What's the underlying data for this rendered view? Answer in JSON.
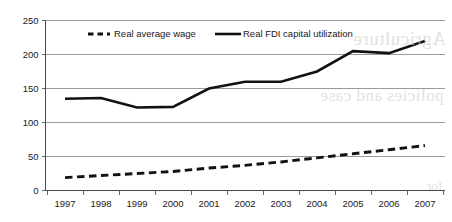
{
  "chart_data": {
    "type": "line",
    "title": "",
    "xlabel": "",
    "ylabel": "",
    "categories": [
      "1997",
      "1998",
      "1999",
      "2000",
      "2001",
      "2002",
      "2003",
      "2004",
      "2005",
      "2006",
      "2007"
    ],
    "series": [
      {
        "name": "Real average wage",
        "style": "dashed",
        "color": "#121212",
        "values": [
          19,
          22,
          25,
          28,
          33,
          37,
          42,
          48,
          54,
          60,
          66
        ]
      },
      {
        "name": "Real FDI capital utilization",
        "style": "solid",
        "color": "#121212",
        "values": [
          135,
          136,
          122,
          123,
          150,
          160,
          160,
          175,
          205,
          202,
          220
        ]
      }
    ],
    "ylim": [
      0,
      250
    ],
    "yticks": [
      0,
      50,
      100,
      150,
      200,
      250
    ],
    "ytick_labels": [
      "0",
      "50",
      "100",
      "150",
      "200",
      "250"
    ],
    "grid": "horizontal",
    "legend_position": "top-inside"
  },
  "legend": {
    "items": [
      {
        "label": "Real average wage",
        "marker": "dashed-line-marker"
      },
      {
        "label": "Real FDI capital utilization",
        "marker": "solid-line-marker"
      }
    ]
  },
  "watermark": {
    "line1": "Agriculture",
    "line2": "policies and case",
    "line3": "for"
  },
  "colors": {
    "series": "#121212",
    "gridline": "#9a9a9a",
    "axis": "#4a4a4a",
    "text": "#1a1a1a",
    "background": "#ffffff"
  }
}
